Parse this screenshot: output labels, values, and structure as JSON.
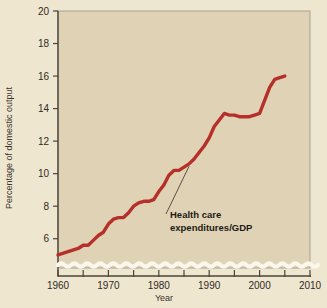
{
  "chart_data": {
    "type": "line",
    "title": "",
    "xlabel": "Year",
    "ylabel": "Percentage of domestic output",
    "xlim": [
      1960,
      2010
    ],
    "ylim": [
      4.2,
      20
    ],
    "grid": false,
    "legend": "none",
    "axis_break": true,
    "axis_break_note": "wavy break on vertical axis below 5",
    "series_color": "#b5302a",
    "plot_background": "#e0d2b4",
    "figure_background": "#efe6d0",
    "xticks": [
      1960,
      1965,
      1970,
      1975,
      1980,
      1985,
      1990,
      1995,
      2000,
      2005,
      2010
    ],
    "xtick_labels": [
      "1960",
      "",
      "1970",
      "",
      "1980",
      "",
      "1990",
      "",
      "2000",
      "",
      "2010"
    ],
    "yticks": [
      6,
      8,
      10,
      12,
      14,
      16,
      18,
      20
    ],
    "ytick_labels": [
      "6",
      "8",
      "10",
      "12",
      "14",
      "16",
      "18",
      "20"
    ],
    "series": [
      {
        "name": "Health care expenditures/GDP",
        "x": [
          1960,
          1962,
          1964,
          1965,
          1966,
          1967,
          1968,
          1969,
          1970,
          1971,
          1972,
          1973,
          1974,
          1975,
          1976,
          1977,
          1978,
          1979,
          1980,
          1981,
          1982,
          1983,
          1984,
          1985,
          1986,
          1987,
          1988,
          1989,
          1990,
          1991,
          1992,
          1993,
          1994,
          1995,
          1996,
          1997,
          1998,
          1999,
          2000,
          2001,
          2002,
          2003,
          2004,
          2005
        ],
        "values": [
          5.0,
          5.2,
          5.4,
          5.6,
          5.6,
          5.9,
          6.2,
          6.4,
          6.9,
          7.2,
          7.3,
          7.3,
          7.6,
          8.0,
          8.2,
          8.3,
          8.3,
          8.4,
          8.9,
          9.3,
          9.9,
          10.2,
          10.2,
          10.4,
          10.6,
          10.9,
          11.3,
          11.7,
          12.2,
          12.9,
          13.3,
          13.7,
          13.6,
          13.6,
          13.5,
          13.5,
          13.5,
          13.6,
          13.7,
          14.5,
          15.3,
          15.8,
          15.9,
          16.0
        ]
      }
    ],
    "annotations": [
      {
        "text_line_1": "Health care",
        "text_line_2": "expenditures/GDP",
        "anchor_year": 1986,
        "anchor_value": 10.7,
        "leader": true
      }
    ]
  }
}
